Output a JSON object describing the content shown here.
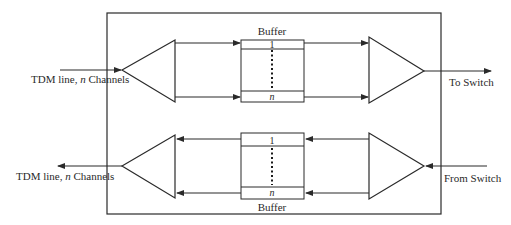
{
  "diagram": {
    "top_path": {
      "input_label_prefix": "TDM line, ",
      "input_label_var": "n",
      "input_label_suffix": " Channels",
      "buffer_label": "Buffer",
      "buffer_first_slot": "1",
      "buffer_last_slot": "n",
      "output_label": "To Switch",
      "direction": "left-to-right"
    },
    "bottom_path": {
      "output_label_prefix": "TDM line, ",
      "output_label_var": "n",
      "output_label_suffix": " Channels",
      "buffer_label": "Buffer",
      "buffer_first_slot": "1",
      "buffer_last_slot": "n",
      "input_label": "From Switch",
      "direction": "right-to-left"
    },
    "components": {
      "demux_icon": "triangle-demultiplexer",
      "mux_icon": "triangle-multiplexer",
      "buffer_icon": "slotted-buffer"
    }
  }
}
